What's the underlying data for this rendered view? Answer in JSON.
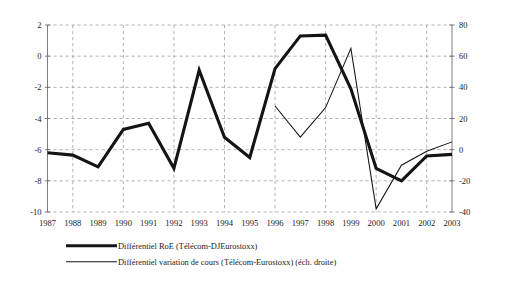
{
  "chart_data": {
    "type": "line",
    "title": "",
    "subtitle": "",
    "xlabel": "",
    "ylabel": "",
    "grid": true,
    "legend_position": "bottom-left",
    "categories": [
      "1987",
      "1988",
      "1989",
      "1990",
      "1991",
      "1992",
      "1993",
      "1994",
      "1995",
      "1996",
      "1997",
      "1998",
      "1999",
      "2000",
      "2001",
      "2002",
      "2003"
    ],
    "x": [
      1987,
      1988,
      1989,
      1990,
      1991,
      1992,
      1993,
      1994,
      1995,
      1996,
      1997,
      1998,
      1999,
      2000,
      2001,
      2002,
      2003
    ],
    "axes": {
      "left": {
        "label": "",
        "ylim": [
          -10,
          2
        ],
        "ticks": [
          -10,
          -8,
          -6,
          -4,
          -2,
          0,
          2
        ],
        "tick_labels": [
          "-10",
          "-8",
          "-6",
          "-4",
          "-2",
          "0",
          "2"
        ]
      },
      "right": {
        "label": "",
        "ylim": [
          -40,
          80
        ],
        "ticks": [
          -40,
          -20,
          0,
          20,
          40,
          60,
          80
        ],
        "tick_labels": [
          "-40",
          "-20",
          "0",
          "20",
          "40",
          "60",
          "80"
        ]
      },
      "xlim": [
        1987,
        2003
      ]
    },
    "series": [
      {
        "name": "Différentiel RoE (Télécom-DJEurostoxx)",
        "axis": "left",
        "style": "thick",
        "color": "#141414",
        "x": [
          1987,
          1988,
          1989,
          1990,
          1991,
          1992,
          1993,
          1994,
          1995,
          1996,
          1997,
          1998,
          1999,
          2000,
          2001,
          2002,
          2003
        ],
        "values": [
          -6.2,
          -6.35,
          -7.1,
          -4.7,
          -4.3,
          -7.2,
          -0.9,
          -5.2,
          -6.5,
          -3.1,
          -4.9,
          -2.2,
          0.3,
          -0.4,
          -0.6,
          -1.1,
          -0.8
        ]
      },
      {
        "name": "Différentiel variation de cours (Télécom-Eurostoxx) (éch. droite)",
        "axis": "right",
        "style": "thin",
        "color": "#141414",
        "x": [
          1996,
          1997,
          1998,
          1999,
          2000,
          2001,
          2002,
          2003
        ],
        "values": [
          28,
          8,
          27,
          65,
          -38,
          -10,
          -1,
          5
        ]
      }
    ],
    "series_thick_values_left_axis": [
      -6.2,
      -6.35,
      -7.1,
      -4.7,
      -4.3,
      -7.2,
      -0.9,
      -5.2,
      -6.5,
      -0.8,
      1.3,
      1.35,
      -2.1,
      -7.2,
      -8.0,
      -6.4,
      -6.3
    ],
    "series_thin_values_right_axis": [
      28,
      8,
      27,
      65,
      -38,
      -10,
      -1,
      5
    ]
  },
  "legend": {
    "entries": [
      {
        "label": "Différentiel RoE (Télécom-DJEurostoxx)",
        "style": "thick"
      },
      {
        "label": "Différentiel variation de cours (Télécom-Eurostoxx) (éch. droite)",
        "style": "thin"
      }
    ]
  }
}
